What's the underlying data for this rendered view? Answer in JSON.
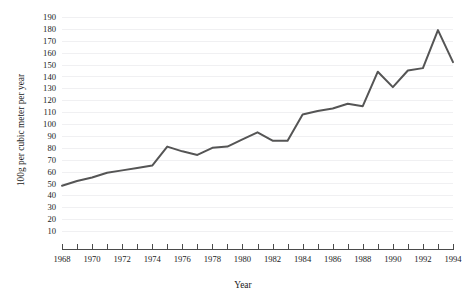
{
  "chart_data": {
    "type": "line",
    "title": "",
    "xlabel": "Year",
    "ylabel": "100g per cubic meter per year",
    "xlim": [
      1968,
      1994
    ],
    "ylim": [
      0,
      195
    ],
    "grid": true,
    "legend": false,
    "line_color": "#555555",
    "x": [
      1968,
      1969,
      1970,
      1971,
      1972,
      1973,
      1974,
      1975,
      1976,
      1977,
      1978,
      1979,
      1980,
      1981,
      1982,
      1983,
      1984,
      1985,
      1986,
      1987,
      1988,
      1989,
      1990,
      1991,
      1992,
      1993,
      1994
    ],
    "values": [
      48,
      52,
      55,
      59,
      61,
      63,
      65,
      81,
      77,
      74,
      80,
      81,
      87,
      93,
      86,
      86,
      108,
      111,
      113,
      117,
      115,
      144,
      131,
      145,
      147,
      179,
      152
    ],
    "x_tick_labels": [
      "1968",
      "1970",
      "1972",
      "1974",
      "1976",
      "1978",
      "1980",
      "1982",
      "1984",
      "1986",
      "1988",
      "1990",
      "1992",
      "1994"
    ],
    "x_tick_values": [
      1968,
      1970,
      1972,
      1974,
      1976,
      1978,
      1980,
      1982,
      1984,
      1986,
      1988,
      1990,
      1992,
      1994
    ],
    "x_minor_ticks": [
      1968,
      1969,
      1970,
      1971,
      1972,
      1973,
      1974,
      1975,
      1976,
      1977,
      1978,
      1979,
      1980,
      1981,
      1982,
      1983,
      1984,
      1985,
      1986,
      1987,
      1988,
      1989,
      1990,
      1991,
      1992,
      1993,
      1994
    ],
    "y_tick_labels": [
      "10",
      "20",
      "30",
      "40",
      "50",
      "60",
      "70",
      "80",
      "90",
      "100",
      "110",
      "120",
      "130",
      "140",
      "150",
      "160",
      "170",
      "180",
      "190"
    ],
    "y_tick_values": [
      10,
      20,
      30,
      40,
      50,
      60,
      70,
      80,
      90,
      100,
      110,
      120,
      130,
      140,
      150,
      160,
      170,
      180,
      190
    ]
  }
}
